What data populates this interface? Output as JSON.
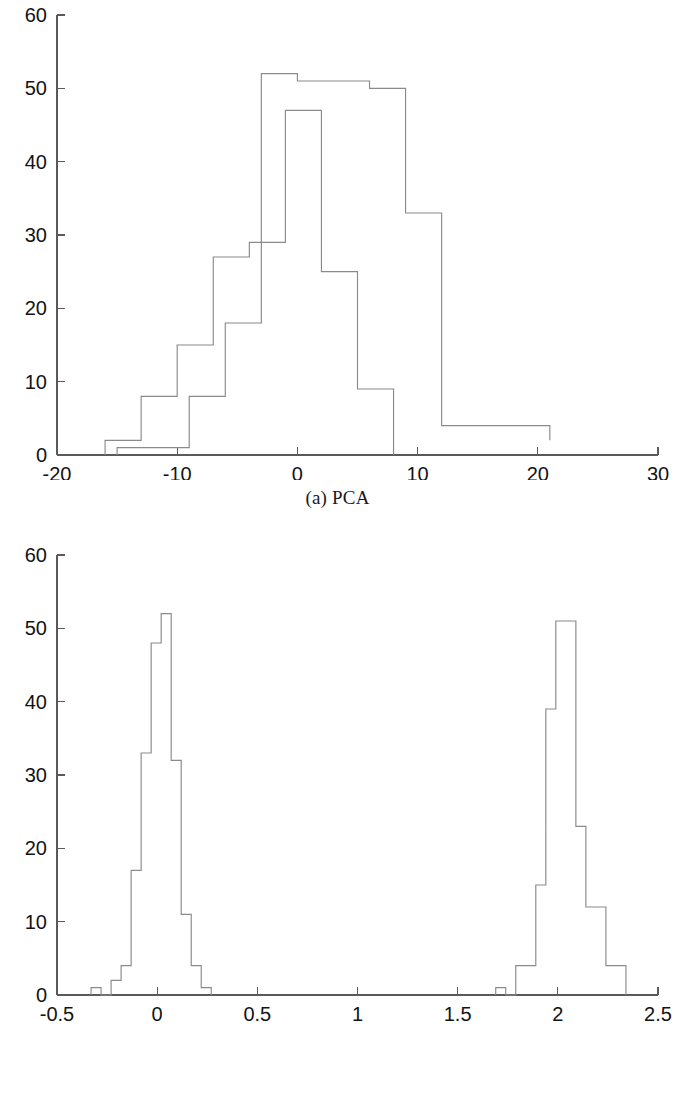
{
  "figure": {
    "background_color": "#ffffff",
    "line_color": "#8a8a8a",
    "axis_color": "#5a5a5a",
    "text_color": "#131313"
  },
  "panels": [
    {
      "id": "a",
      "caption": "(a) PCA"
    },
    {
      "id": "b",
      "caption": "(b) FLD"
    }
  ],
  "chart_data": [
    {
      "type": "bar",
      "title": "(a) PCA",
      "xlabel": "",
      "ylabel": "",
      "xlim": [
        -20,
        30
      ],
      "ylim": [
        0,
        60
      ],
      "xticks": [
        -20,
        -10,
        0,
        10,
        20,
        30
      ],
      "xtick_labels": [
        "-20",
        "-10",
        "0",
        "10",
        "20",
        "30"
      ],
      "yticks": [
        0,
        10,
        20,
        30,
        40,
        50,
        60
      ],
      "ytick_labels": [
        "0",
        "10",
        "20",
        "30",
        "40",
        "50",
        "60"
      ],
      "grid": false,
      "legend": null,
      "notes": "Two overlapping outline histograms (step/stairs style), no fill, thin gray strokes.",
      "series": [
        {
          "name": "class-1",
          "bin_edges": [
            -16,
            -13,
            -10,
            -7,
            -4,
            -1,
            2,
            5,
            8
          ],
          "values": [
            2,
            8,
            15,
            27,
            29,
            47,
            25,
            9
          ]
        },
        {
          "name": "class-2",
          "bin_edges": [
            -15,
            -12,
            -9,
            -6,
            -3,
            0,
            3,
            6,
            9,
            12,
            15,
            18,
            21
          ],
          "values": [
            1,
            1,
            8,
            18,
            52,
            51,
            51,
            50,
            33,
            4,
            4,
            4,
            2
          ]
        }
      ]
    },
    {
      "type": "bar",
      "title": "(b) FLD",
      "xlabel": "",
      "ylabel": "",
      "xlim": [
        -0.5,
        2.5
      ],
      "ylim": [
        0,
        60
      ],
      "xticks": [
        -0.5,
        0,
        0.5,
        1,
        1.5,
        2,
        2.5
      ],
      "xtick_labels": [
        "-0.5",
        "0",
        "0.5",
        "1",
        "1.5",
        "2",
        "2.5"
      ],
      "yticks": [
        0,
        10,
        20,
        30,
        40,
        50,
        60
      ],
      "ytick_labels": [
        "0",
        "10",
        "20",
        "30",
        "40",
        "50",
        "60"
      ],
      "grid": false,
      "legend": null,
      "notes": "Two well separated narrow outline histograms, plus two isolated single-count outlier bars.",
      "series": [
        {
          "name": "cluster-left",
          "bin_edges": [
            -0.33,
            -0.28,
            -0.23,
            -0.18,
            -0.13,
            -0.08,
            -0.03,
            0.02,
            0.07,
            0.12,
            0.17,
            0.22,
            0.27
          ],
          "values": [
            1,
            0,
            2,
            4,
            17,
            33,
            48,
            52,
            32,
            11,
            4,
            1
          ]
        },
        {
          "name": "cluster-right",
          "bin_edges": [
            1.69,
            1.74,
            1.79,
            1.84,
            1.89,
            1.94,
            1.99,
            2.04,
            2.09,
            2.14,
            2.19,
            2.24,
            2.29,
            2.34
          ],
          "values": [
            1,
            0,
            4,
            4,
            15,
            39,
            51,
            51,
            23,
            12,
            12,
            4,
            4
          ]
        }
      ]
    }
  ]
}
